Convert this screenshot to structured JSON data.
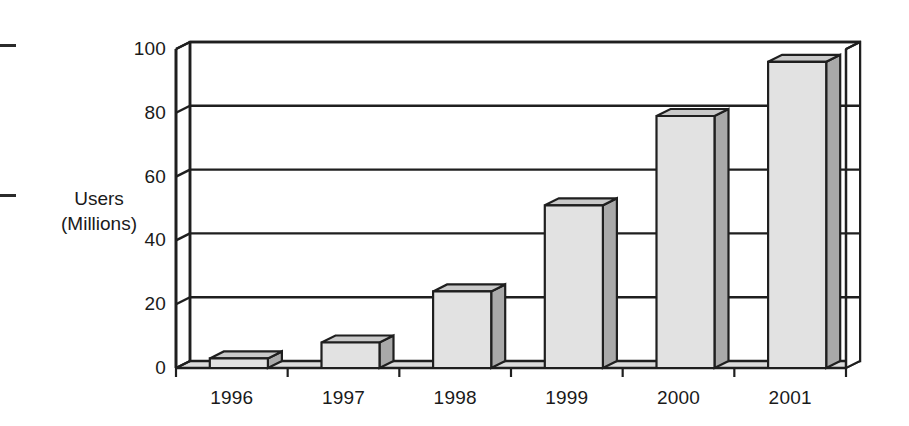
{
  "chart_data": {
    "type": "bar",
    "title": "",
    "subtitle": "",
    "xlabel": "",
    "ylabel": "Users (Millions)",
    "ylabel_lines": [
      "Users",
      "(Millions)"
    ],
    "categories": [
      "1996",
      "1997",
      "1998",
      "1999",
      "2000",
      "2001"
    ],
    "values": [
      3,
      8,
      24,
      51,
      79,
      96
    ],
    "series": [
      {
        "name": "Users (Millions)",
        "values": [
          3,
          8,
          24,
          51,
          79,
          96
        ]
      }
    ],
    "ylim": [
      0,
      100
    ],
    "yticks": [
      0,
      20,
      40,
      60,
      80,
      100
    ],
    "ytick_labels": [
      "0",
      "20",
      "40",
      "60",
      "80",
      "100"
    ],
    "grid": true,
    "grid_orientation": "horizontal",
    "legend": "none",
    "style": "3d-bar",
    "annotations": []
  },
  "style": {
    "bar_front_color": "#e2e2e2",
    "bar_side_color": "#a9a9a9",
    "bar_top_color": "#c9c9c9",
    "outline_color": "#1f1f1f",
    "floor_color": "#dcdcdc",
    "background_color": "#ffffff",
    "text_color": "#1a1a1a"
  },
  "marks": {
    "crop_mark_top": "crop-mark",
    "crop_mark_bottom": "crop-mark"
  }
}
